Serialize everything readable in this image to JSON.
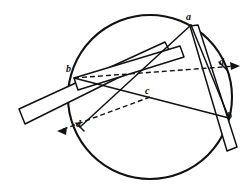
{
  "figure": {
    "background_color": "#ffffff",
    "ink_color": "#111111",
    "width": 247,
    "height": 194,
    "circle": {
      "name": "main-circle",
      "center_x": 150,
      "center_y": 97,
      "radius": 82,
      "stroke_width": 2.1,
      "style": "solid"
    },
    "labels": [
      {
        "id": "a",
        "text": "a",
        "x": 186,
        "y": 12
      },
      {
        "id": "b1",
        "text": "b",
        "x": 66,
        "y": 64
      },
      {
        "id": "c",
        "text": "c",
        "x": 145,
        "y": 86
      },
      {
        "id": "d1",
        "text": "d",
        "x": 219,
        "y": 57
      },
      {
        "id": "d2",
        "text": "d",
        "x": 76,
        "y": 119
      },
      {
        "id": "b2",
        "text": "b",
        "x": 227,
        "y": 111
      }
    ],
    "points": {
      "a": {
        "x": 191,
        "y": 25
      },
      "b1": {
        "x": 74,
        "y": 78
      },
      "c": {
        "x": 150,
        "y": 97
      },
      "d1": {
        "x": 223,
        "y": 70
      },
      "d2": {
        "x": 80,
        "y": 127
      },
      "b2": {
        "x": 229,
        "y": 118
      }
    },
    "bars": [
      {
        "name": "long-straightedge-bar",
        "description": "long rectangular straightedge running from lower-left out of circle up to the right",
        "corners": [
          [
            19,
            109
          ],
          [
            165,
            42
          ],
          [
            170,
            52
          ],
          [
            25,
            124
          ]
        ]
      },
      {
        "name": "inner-straightedge-bar",
        "description": "second straightedge forming the inner rectangle edge, meeting at upper right",
        "corners": [
          [
            74,
            78
          ],
          [
            180,
            46
          ],
          [
            184,
            56
          ],
          [
            78,
            89
          ]
        ]
      },
      {
        "name": "vertical-straightedge-bar",
        "description": "narrow rectangular bar descending from upper right to lower right",
        "corners": [
          [
            190,
            26
          ],
          [
            198,
            25
          ],
          [
            236,
            146
          ],
          [
            226,
            150
          ]
        ]
      }
    ],
    "chords": [
      {
        "name": "chord-a-to-d2",
        "from": "a",
        "to": "d2",
        "style": "solid"
      },
      {
        "name": "chord-a-to-b2",
        "from": "a",
        "to": "b2",
        "style": "solid"
      },
      {
        "name": "chord-b1-to-b2",
        "from": "b1",
        "to": "b2",
        "style": "solid"
      }
    ],
    "dashed_lines": [
      {
        "name": "dashed-axis-b1-to-d1",
        "from": "b1",
        "to": "d1",
        "style": "dashed",
        "arrow_at": "d1",
        "extends_to": [
          239,
          66
        ]
      },
      {
        "name": "dashed-axis-c-to-d2",
        "from": "c",
        "to": "d2",
        "style": "dashed",
        "arrow_at": "d2",
        "extends_to": [
          58,
          131
        ]
      }
    ],
    "arrows": [
      {
        "name": "arrow-right",
        "tip_x": 239,
        "tip_y": 66,
        "direction": "right"
      },
      {
        "name": "arrow-left",
        "tip_x": 58,
        "tip_y": 131,
        "direction": "left"
      }
    ]
  }
}
